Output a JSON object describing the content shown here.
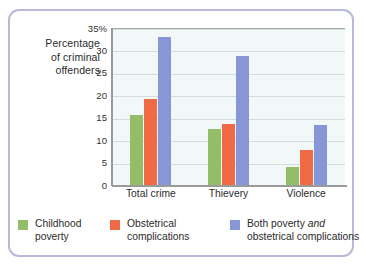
{
  "chart_data": {
    "type": "bar",
    "title": "",
    "xlabel": "",
    "ylabel": "Percentage of criminal offenders",
    "ylabel_lines": [
      "Percentage",
      "of criminal",
      "offenders"
    ],
    "categories": [
      "Total crime",
      "Thievery",
      "Violence"
    ],
    "series": [
      {
        "name": "Childhood poverty",
        "color": "#94bd68",
        "values": [
          15.7,
          12.5,
          4.0
        ]
      },
      {
        "name": "Obstetrical complications",
        "color": "#ef6a45",
        "values": [
          19.2,
          13.7,
          7.8
        ]
      },
      {
        "name": "Both poverty and obstetrical complications",
        "color": "#8696d6",
        "values": [
          33.0,
          28.7,
          13.3
        ]
      }
    ],
    "ylim": [
      0,
      35
    ],
    "ytick_values": [
      0,
      5,
      10,
      15,
      20,
      25,
      30,
      35
    ],
    "ytick_labels": [
      "0",
      "5",
      "10",
      "15",
      "20",
      "25",
      "30",
      "35%"
    ],
    "grid": true,
    "legend_position": "bottom",
    "plot_background": "#f2f8f8",
    "gridline_color": "#d2dede",
    "frame_color": "#b9b9dd"
  },
  "legend": {
    "items": [
      {
        "label_line1": "Childhood",
        "label_line2": "poverty",
        "color": "#94bd68"
      },
      {
        "label_line1": "Obstetrical",
        "label_line2": "complications",
        "color": "#ef6a45"
      },
      {
        "label_line1_pre": "Both poverty ",
        "label_line1_em": "and",
        "label_line2": "obstetrical complications",
        "color": "#8696d6"
      }
    ]
  }
}
